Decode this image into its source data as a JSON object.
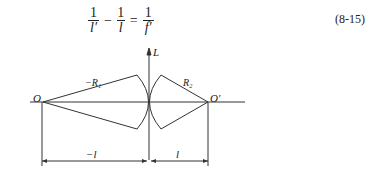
{
  "equation": {
    "terms": [
      {
        "num": "1",
        "den": "l′"
      },
      {
        "op": "−"
      },
      {
        "num": "1",
        "den": "l"
      },
      {
        "op": "="
      },
      {
        "num": "1",
        "den": "f′"
      }
    ],
    "t1_num": "1",
    "t1_den": "l′",
    "op1": "−",
    "t2_num": "1",
    "t2_den": "l",
    "op2": "=",
    "t3_num": "1",
    "t3_den": "f′",
    "number": "(8-15)"
  },
  "figure": {
    "axis_label": "L",
    "left_point": "O",
    "right_point": "O′",
    "left_radius": "−R₁",
    "right_radius": "R₂",
    "left_distance": "−l",
    "right_distance": "l"
  }
}
